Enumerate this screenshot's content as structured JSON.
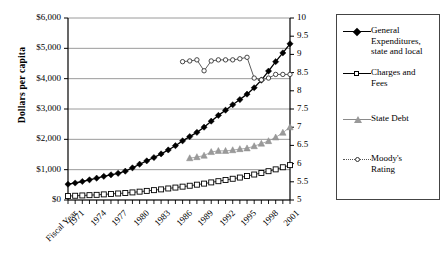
{
  "chart_data": {
    "type": "line",
    "title": "",
    "xlabel": "Fiscal Year",
    "ylabel": "Dollars per capita",
    "y2label": "Credit Rating on Ten Point Scale",
    "grid": true,
    "legend_position": "right",
    "x": [
      1970,
      1971,
      1972,
      1973,
      1974,
      1975,
      1976,
      1977,
      1978,
      1979,
      1980,
      1981,
      1982,
      1983,
      1984,
      1985,
      1986,
      1987,
      1988,
      1989,
      1990,
      1991,
      1992,
      1993,
      1994,
      1995,
      1996,
      1997,
      1998,
      1999,
      2000,
      2001
    ],
    "xtick_labels": [
      "Fiscal Year",
      "1971",
      "1974",
      "1977",
      "1980",
      "1983",
      "1986",
      "1989",
      "1992",
      "1995",
      "1998",
      "2001"
    ],
    "ylim": [
      0,
      6000
    ],
    "ytick_labels": [
      "$0",
      "$1,000",
      "$2,000",
      "$3,000",
      "$4,000",
      "$5,000",
      "$6,000"
    ],
    "ytick_values": [
      0,
      1000,
      2000,
      3000,
      4000,
      5000,
      6000
    ],
    "y2lim": [
      5,
      10
    ],
    "y2tick_labels": [
      "5",
      "5.5",
      "6",
      "6.5",
      "7",
      "7.5",
      "8",
      "8.5",
      "9",
      "9.5",
      "10"
    ],
    "y2tick_values": [
      5,
      5.5,
      6,
      6.5,
      7,
      7.5,
      8,
      8.5,
      9,
      9.5,
      10
    ],
    "series": [
      {
        "name": "General Expenditures, state and local",
        "axis": "left",
        "marker": "filled-diamond",
        "color": "#000000",
        "values": [
          520,
          560,
          610,
          665,
          720,
          780,
          830,
          880,
          950,
          1060,
          1180,
          1290,
          1400,
          1520,
          1650,
          1790,
          1950,
          2090,
          2230,
          2400,
          2600,
          2790,
          2960,
          3140,
          3310,
          3490,
          3700,
          3950,
          4250,
          4560,
          4850,
          5150
        ]
      },
      {
        "name": "Charges and Fees",
        "axis": "left",
        "marker": "open-square",
        "color": "#000000",
        "values": [
          130,
          140,
          150,
          160,
          170,
          185,
          200,
          215,
          230,
          250,
          275,
          300,
          325,
          350,
          380,
          410,
          440,
          470,
          505,
          540,
          580,
          620,
          660,
          700,
          740,
          790,
          840,
          890,
          950,
          1010,
          1080,
          1150
        ]
      },
      {
        "name": "State Debt",
        "axis": "right",
        "marker": "filled-triangle",
        "color": "#999999",
        "values": [
          null,
          null,
          null,
          null,
          null,
          null,
          null,
          null,
          null,
          null,
          null,
          null,
          null,
          null,
          null,
          null,
          null,
          6.15,
          6.18,
          6.22,
          6.32,
          6.35,
          6.35,
          6.37,
          6.4,
          6.42,
          6.48,
          6.55,
          6.62,
          6.72,
          6.85,
          7.0
        ]
      },
      {
        "name": "Moody's Rating",
        "axis": "right",
        "marker": "open-circle",
        "color": "#333333",
        "values": [
          null,
          null,
          null,
          null,
          null,
          null,
          null,
          null,
          null,
          null,
          null,
          null,
          null,
          null,
          null,
          null,
          8.8,
          8.82,
          8.85,
          8.55,
          8.82,
          8.85,
          8.85,
          8.85,
          8.88,
          8.92,
          8.35,
          8.3,
          8.35,
          8.45,
          8.45,
          8.45
        ]
      }
    ]
  },
  "axes": {
    "left_title": "Dollars per capita",
    "right_title": "Credit Rating on Ten Point Scale",
    "x_first_label": "Fiscal Year"
  },
  "legend": {
    "items": [
      {
        "label_line1": "General",
        "label_line2": "Expenditures,",
        "label_line3": "state and local",
        "marker": "filled-diamond-icon"
      },
      {
        "label_line1": "Charges and",
        "label_line2": "Fees",
        "label_line3": "",
        "marker": "open-square-icon"
      },
      {
        "label_line1": "State Debt",
        "label_line2": "",
        "label_line3": "",
        "marker": "filled-triangle-icon"
      },
      {
        "label_line1": "Moody's",
        "label_line2": "Rating",
        "label_line3": "",
        "marker": "open-circle-icon"
      }
    ]
  }
}
